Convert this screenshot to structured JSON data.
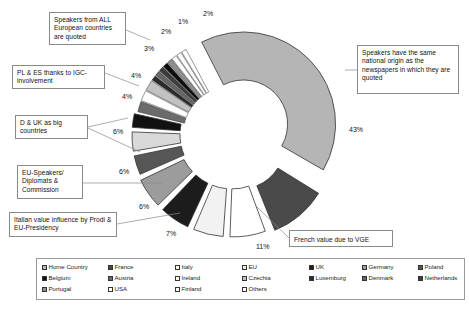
{
  "chart_data": {
    "type": "pie",
    "title": "",
    "subtitle": "",
    "variant": "exploded-doughnut",
    "xlabel": "",
    "ylabel": "",
    "legend_position": "bottom",
    "grid": false,
    "categories": [
      "Home Country",
      "France",
      "Italy",
      "EU",
      "UK",
      "Germany",
      "Poland",
      "Spain",
      "Belgium",
      "Austria",
      "Ireland",
      "Czechia",
      "Luxemburg",
      "Denmark",
      "Netherlands",
      "Greece",
      "Portugal",
      "USA",
      "Finland",
      "Others"
    ],
    "values": [
      43,
      11,
      7,
      6,
      6,
      6,
      4,
      4,
      3,
      2,
      2,
      2,
      1,
      1,
      1,
      1,
      1,
      1,
      1,
      1
    ],
    "labels": [
      "43%",
      "11%",
      "7%",
      "6%",
      "6%",
      "6%",
      "4%",
      "4%",
      "3%",
      "2%",
      "1%",
      "2%"
    ],
    "annotations": [
      "Speakers from ALL European countries are quoted",
      "PL & ES thanks to IGC-involvement",
      "D & UK as big countries",
      "EU-Speakers/ Diplomats & Commission",
      "Italian value influence by Prodi & EU-Presidency",
      "French value due to VGE",
      "Speakers have the same national origin as the newspapers in which they are quoted"
    ]
  },
  "slice_labels": {
    "p43": "43%",
    "p11": "11%",
    "p7": "7%",
    "p6a": "6%",
    "p6b": "6%",
    "p6c": "6%",
    "p4a": "4%",
    "p4b": "4%",
    "p3": "3%",
    "p2a": "2%",
    "p1": "1%",
    "p2b": "2%"
  },
  "callouts": {
    "all_european": "Speakers from ALL European countries are quoted",
    "pl_es": "PL & ES thanks to IGC-involvement",
    "d_uk": "D & UK as big countries",
    "eu_speakers": "EU-Speakers/ Diplomats & Commission",
    "italian_value": "Italian value influence by Prodi & EU-Presidency",
    "french_value": "French value due to VGE",
    "same_origin": "Speakers have the same national origin as the newspapers in which they are quoted"
  },
  "legend": {
    "rows": [
      [
        {
          "label": "Home Country",
          "color": "#b5b5b5"
        },
        {
          "label": "France",
          "color": "#4a4a4a"
        },
        {
          "label": "Italy",
          "color": "#ffffff"
        },
        {
          "label": "EU",
          "color": "#f2f2f2"
        },
        {
          "label": "UK",
          "color": "#1c1c1c"
        },
        {
          "label": "Germany",
          "color": "#9c9c9c"
        },
        {
          "label": "Poland",
          "color": "#575757"
        },
        {
          "label": "Spain",
          "color": "#d9d9d9"
        }
      ],
      [
        {
          "label": "Belgium",
          "color": "#111111"
        },
        {
          "label": "Austria",
          "color": "#6b6b6b"
        },
        {
          "label": "Ireland",
          "color": "#ffffff"
        },
        {
          "label": "Czechia",
          "color": "#c2c2c2"
        },
        {
          "label": "Luxemburg",
          "color": "#2b2b2b"
        },
        {
          "label": "Denmark",
          "color": "#666666"
        },
        {
          "label": "Netherlands",
          "color": "#3d3d3d"
        },
        {
          "label": "Greece",
          "color": "#0d0d0d"
        }
      ],
      [
        {
          "label": "Portugal",
          "color": "#8f8f8f"
        },
        {
          "label": "USA",
          "color": "#ffffff"
        },
        {
          "label": "Finland",
          "color": "#fafafa"
        },
        {
          "label": "Others",
          "color": "#ffffff"
        }
      ]
    ],
    "column_x": [
      0,
      66,
      133,
      200,
      267,
      320,
      376,
      430
    ]
  },
  "colors": {
    "home_country": "#b5b5b5",
    "france": "#4a4a4a",
    "italy": "#ffffff",
    "eu": "#f2f2f2",
    "uk": "#1c1c1c",
    "germany": "#9c9c9c",
    "poland": "#575757",
    "spain": "#d9d9d9",
    "outline": "#333333",
    "callout_border": "#8a8a8a",
    "leader_line": "#8a8a8a"
  }
}
